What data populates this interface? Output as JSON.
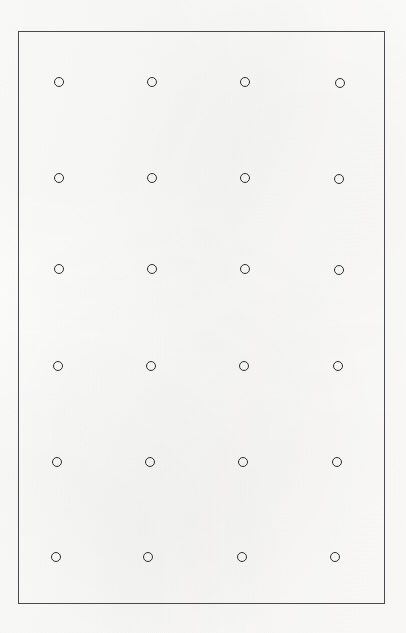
{
  "canvas": {
    "width": 406,
    "height": 633,
    "background_color": "#fcfcfb",
    "description": "Scanned sheet with a thin rectangular border enclosing a grid of small hollow circles"
  },
  "frame": {
    "name": "border-rectangle",
    "x": 18,
    "y": 31,
    "width": 367,
    "height": 573,
    "border_color": "#4a4a4e",
    "border_width": 1
  },
  "grid": {
    "columns": 4,
    "rows": 6,
    "total_marks": 24,
    "mark_shape": "circle",
    "mark_outline_color": "#2e2e30",
    "mark_fill": "none",
    "mark_diameter": 10,
    "mark_stroke_width": 1.4,
    "column_centers_x": [
      59,
      152,
      245,
      340
    ],
    "row_centers_y": [
      82,
      178,
      269,
      366,
      462,
      557
    ],
    "marks": [
      {
        "id": "mark-r1c1",
        "row": 1,
        "col": 1,
        "cx": 59,
        "cy": 82,
        "d": 10
      },
      {
        "id": "mark-r1c2",
        "row": 1,
        "col": 2,
        "cx": 152,
        "cy": 82,
        "d": 10
      },
      {
        "id": "mark-r1c3",
        "row": 1,
        "col": 3,
        "cx": 245,
        "cy": 82,
        "d": 10
      },
      {
        "id": "mark-r1c4",
        "row": 1,
        "col": 4,
        "cx": 340,
        "cy": 83,
        "d": 10
      },
      {
        "id": "mark-r2c1",
        "row": 2,
        "col": 1,
        "cx": 59,
        "cy": 178,
        "d": 10
      },
      {
        "id": "mark-r2c2",
        "row": 2,
        "col": 2,
        "cx": 152,
        "cy": 178,
        "d": 10
      },
      {
        "id": "mark-r2c3",
        "row": 2,
        "col": 3,
        "cx": 245,
        "cy": 178,
        "d": 10
      },
      {
        "id": "mark-r2c4",
        "row": 2,
        "col": 4,
        "cx": 339,
        "cy": 179,
        "d": 10
      },
      {
        "id": "mark-r3c1",
        "row": 3,
        "col": 1,
        "cx": 59,
        "cy": 269,
        "d": 10
      },
      {
        "id": "mark-r3c2",
        "row": 3,
        "col": 2,
        "cx": 152,
        "cy": 269,
        "d": 10
      },
      {
        "id": "mark-r3c3",
        "row": 3,
        "col": 3,
        "cx": 245,
        "cy": 269,
        "d": 10
      },
      {
        "id": "mark-r3c4",
        "row": 3,
        "col": 4,
        "cx": 339,
        "cy": 270,
        "d": 10
      },
      {
        "id": "mark-r4c1",
        "row": 4,
        "col": 1,
        "cx": 58,
        "cy": 366,
        "d": 10
      },
      {
        "id": "mark-r4c2",
        "row": 4,
        "col": 2,
        "cx": 151,
        "cy": 366,
        "d": 10
      },
      {
        "id": "mark-r4c3",
        "row": 4,
        "col": 3,
        "cx": 244,
        "cy": 366,
        "d": 10
      },
      {
        "id": "mark-r4c4",
        "row": 4,
        "col": 4,
        "cx": 338,
        "cy": 366,
        "d": 10
      },
      {
        "id": "mark-r5c1",
        "row": 5,
        "col": 1,
        "cx": 57,
        "cy": 462,
        "d": 10
      },
      {
        "id": "mark-r5c2",
        "row": 5,
        "col": 2,
        "cx": 150,
        "cy": 462,
        "d": 10
      },
      {
        "id": "mark-r5c3",
        "row": 5,
        "col": 3,
        "cx": 243,
        "cy": 462,
        "d": 10
      },
      {
        "id": "mark-r5c4",
        "row": 5,
        "col": 4,
        "cx": 337,
        "cy": 462,
        "d": 10
      },
      {
        "id": "mark-r6c1",
        "row": 6,
        "col": 1,
        "cx": 56,
        "cy": 557,
        "d": 10
      },
      {
        "id": "mark-r6c2",
        "row": 6,
        "col": 2,
        "cx": 148,
        "cy": 557,
        "d": 10
      },
      {
        "id": "mark-r6c3",
        "row": 6,
        "col": 3,
        "cx": 242,
        "cy": 557,
        "d": 10
      },
      {
        "id": "mark-r6c4",
        "row": 6,
        "col": 4,
        "cx": 335,
        "cy": 557,
        "d": 10
      }
    ]
  }
}
